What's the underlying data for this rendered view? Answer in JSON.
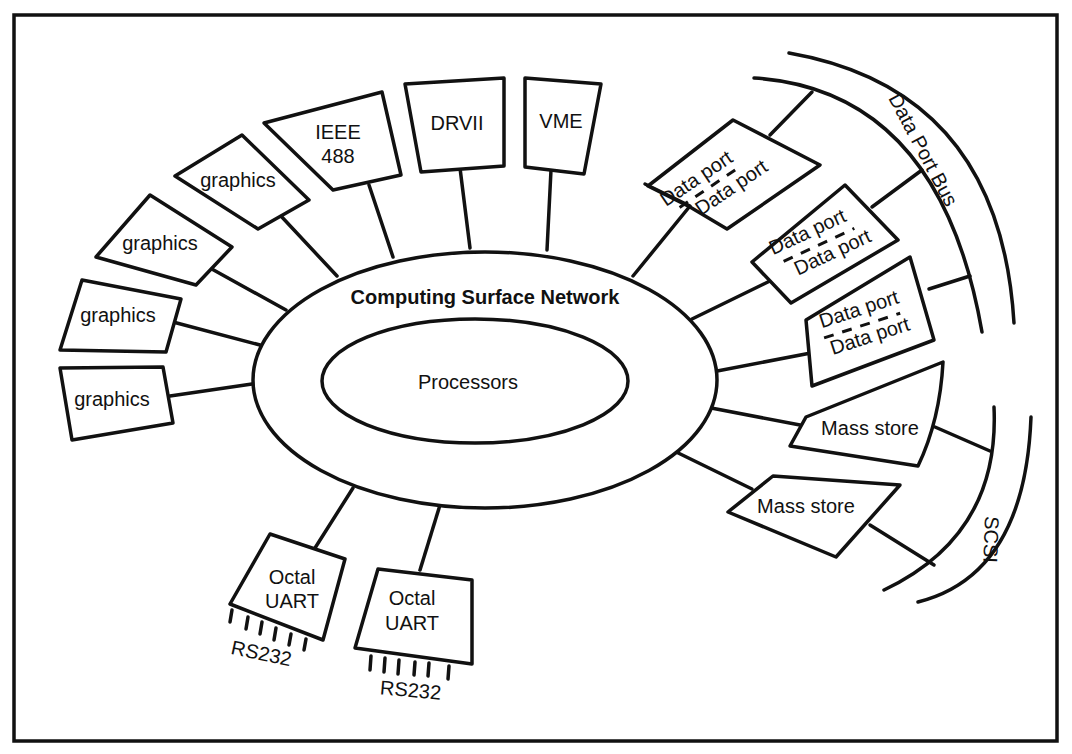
{
  "diagram": {
    "network_label": "Computing Surface Network",
    "core_label": "Processors",
    "nodes": [
      {
        "id": "graphics-1",
        "label": "graphics"
      },
      {
        "id": "graphics-2",
        "label": "graphics"
      },
      {
        "id": "graphics-3",
        "label": "graphics"
      },
      {
        "id": "graphics-4",
        "label": "graphics"
      },
      {
        "id": "ieee-488",
        "line1": "IEEE",
        "line2": "488"
      },
      {
        "id": "drvii",
        "label": "DRVII"
      },
      {
        "id": "vme",
        "label": "VME"
      },
      {
        "id": "data-port-pair-1",
        "line1": "Data port",
        "line2": "Data port"
      },
      {
        "id": "data-port-pair-2",
        "line1": "Data port",
        "line2": "Data port"
      },
      {
        "id": "data-port-pair-3",
        "line1": "Data port",
        "line2": "Data port"
      },
      {
        "id": "mass-store-1",
        "label": "Mass store"
      },
      {
        "id": "mass-store-2",
        "label": "Mass store"
      },
      {
        "id": "octal-uart-1",
        "line1": "Octal",
        "line2": "UART",
        "port_label": "RS232"
      },
      {
        "id": "octal-uart-2",
        "line1": "Octal",
        "line2": "UART",
        "port_label": "RS232"
      }
    ],
    "buses": {
      "data_port_bus": "Data Port Bus",
      "scsi": "SCSI"
    }
  }
}
